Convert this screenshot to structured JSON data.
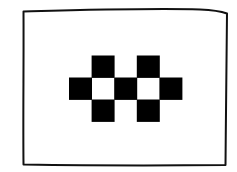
{
  "figure": {
    "frame_color": "#111111",
    "background_color": "#ffffff",
    "cell_fill_color": "#000000"
  },
  "grid": {
    "rows": 3,
    "cols": 5,
    "cells": [
      [
        0,
        1,
        0,
        1,
        0
      ],
      [
        1,
        0,
        1,
        0,
        1
      ],
      [
        0,
        1,
        0,
        1,
        0
      ]
    ]
  }
}
